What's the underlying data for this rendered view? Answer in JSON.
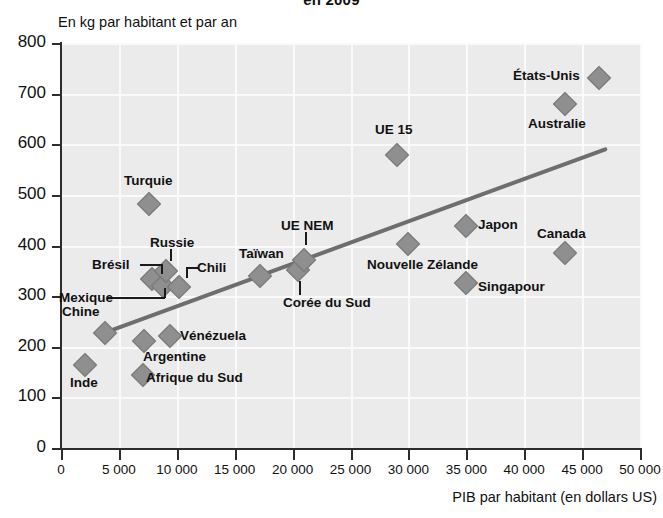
{
  "chart_data": {
    "type": "scatter",
    "title": "en 2009",
    "subtitle": "",
    "ylabel": "En kg par habitant et par an",
    "xlabel": "PIB par habitant (en dollars US)",
    "xlim": [
      0,
      50000
    ],
    "ylim": [
      0,
      800
    ],
    "xticks": [
      0,
      5000,
      10000,
      15000,
      20000,
      25000,
      30000,
      35000,
      40000,
      45000,
      50000
    ],
    "xticklabels": [
      "0",
      "5 000",
      "10 000",
      "15 000",
      "20 000",
      "25 000",
      "30 000",
      "35 000",
      "40 000",
      "45 000",
      "50 000"
    ],
    "yticks": [
      0,
      100,
      200,
      300,
      400,
      500,
      600,
      700,
      800
    ],
    "yticklabels": [
      "0",
      "100",
      "200",
      "300",
      "400",
      "500",
      "600",
      "700",
      "800"
    ],
    "grid": true,
    "legend": false,
    "marker_color": "#8f8f8f",
    "trendline_color": "#6e6e6e",
    "plot_background": "#ebebeb",
    "points": [
      {
        "label": "Inde",
        "x": 2100,
        "y": 163
      },
      {
        "label": "Chine",
        "x": 3800,
        "y": 228
      },
      {
        "label": "Afrique du Sud",
        "x": 7100,
        "y": 145
      },
      {
        "label": "Argentine",
        "x": 7200,
        "y": 212
      },
      {
        "label": "Turquie",
        "x": 7600,
        "y": 481
      },
      {
        "label": "Brésil",
        "x": 7900,
        "y": 333
      },
      {
        "label": "Mexique",
        "x": 8800,
        "y": 320
      },
      {
        "label": "Russie",
        "x": 9100,
        "y": 350
      },
      {
        "label": "Vénézuela",
        "x": 9400,
        "y": 222
      },
      {
        "label": "Chili",
        "x": 10200,
        "y": 318
      },
      {
        "label": "Taïwan",
        "x": 17200,
        "y": 340
      },
      {
        "label": "Corée du Sud",
        "x": 20500,
        "y": 352
      },
      {
        "label": "UE NEM",
        "x": 21000,
        "y": 372
      },
      {
        "label": "UE 15",
        "x": 29000,
        "y": 578
      },
      {
        "label": "Nouvelle Zélande",
        "x": 30000,
        "y": 403
      },
      {
        "label": "Singapour",
        "x": 35000,
        "y": 325
      },
      {
        "label": "Japon",
        "x": 35000,
        "y": 438
      },
      {
        "label": "Canada",
        "x": 43500,
        "y": 385
      },
      {
        "label": "Australie",
        "x": 43500,
        "y": 680
      },
      {
        "label": "États-Unis",
        "x": 46500,
        "y": 730
      }
    ],
    "trendline": {
      "x0": 3800,
      "y0": 228,
      "x1": 47000,
      "y1": 590
    }
  },
  "labels": {
    "inde": "Inde",
    "chine": "Chine",
    "afrique_du_sud": "Afrique du Sud",
    "argentine": "Argentine",
    "turquie": "Turquie",
    "bresil": "Brésil",
    "mexique": "Mexique",
    "russie": "Russie",
    "venezuela": "Vénézuela",
    "chili": "Chili",
    "taiwan": "Taïwan",
    "coree_du_sud": "Corée du Sud",
    "ue_nem": "UE NEM",
    "ue_15": "UE 15",
    "nouvelle_zelande": "Nouvelle Zélande",
    "singapour": "Singapour",
    "japon": "Japon",
    "canada": "Canada",
    "australie": "Australie",
    "etats_unis": "États-Unis"
  }
}
